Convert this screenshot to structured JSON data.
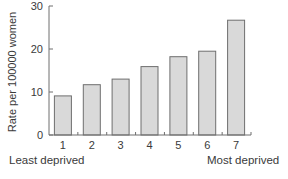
{
  "chart_data": {
    "type": "bar",
    "title": "",
    "xlabel": "",
    "ylabel": "Rate per 100000 women",
    "categories": [
      "1",
      "2",
      "3",
      "4",
      "5",
      "6",
      "7"
    ],
    "values": [
      9.1,
      11.7,
      13.0,
      15.9,
      18.2,
      19.5,
      26.7
    ],
    "ylim": [
      0,
      30
    ],
    "yticks": [
      0,
      10,
      20,
      30
    ],
    "grid": false,
    "legend": null,
    "annotations": {
      "left": "Least deprived",
      "right": "Most deprived"
    },
    "colors": {
      "bar_fill": "#d9d9d9",
      "bar_stroke": "#6e6e6e",
      "axis": "#6e6e6e",
      "text": "#3a3a3a"
    }
  }
}
